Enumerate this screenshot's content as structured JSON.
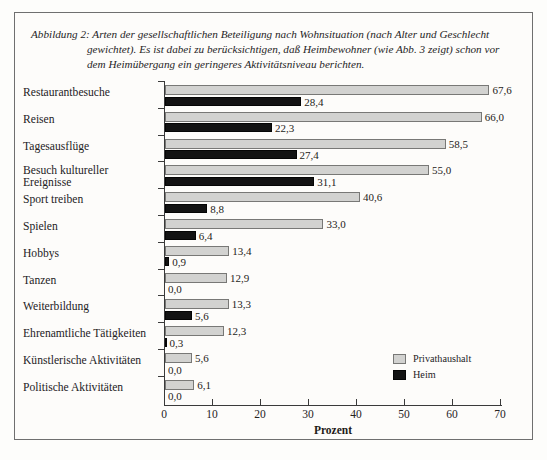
{
  "caption": {
    "lines": [
      "Abbildung 2: Arten der gesellschaftlichen Beteiligung nach Wohnsituation (nach Alter und Geschlecht",
      "gewichtet). Es ist dabei zu berücksichtigen, daß Heimbewohner (wie Abb. 3 zeigt) schon vor",
      "dem Heimübergang ein geringeres Aktivitätsniveau berichten."
    ]
  },
  "chart_data": {
    "type": "bar",
    "orientation": "horizontal",
    "xlabel": "Prozent",
    "ylabel": "",
    "xlim": [
      0,
      70
    ],
    "xticks": [
      0,
      10,
      20,
      30,
      40,
      50,
      60,
      70
    ],
    "xticklabels": [
      "0",
      "10",
      "20",
      "30",
      "40",
      "50",
      "60",
      "70"
    ],
    "grid": false,
    "legend_position": "bottom-right",
    "categories": [
      "Restaurantbesuche",
      "Reisen",
      "Tagesausflüge",
      "Besuch kultureller Ereignisse",
      "Sport treiben",
      "Spielen",
      "Hobbys",
      "Tanzen",
      "Weiterbildung",
      "Ehrenamtliche Tätigkeiten",
      "Künstlerische Aktivitäten",
      "Politische Aktivitäten"
    ],
    "category_lines": [
      [
        "Restaurantbesuche"
      ],
      [
        "Reisen"
      ],
      [
        "Tagesausflüge"
      ],
      [
        "Besuch kultureller",
        "Ereignisse"
      ],
      [
        "Sport treiben"
      ],
      [
        "Spielen"
      ],
      [
        "Hobbys"
      ],
      [
        "Tanzen"
      ],
      [
        "Weiterbildung"
      ],
      [
        "Ehrenamtliche Tätigkeiten"
      ],
      [
        "Künstlerische Aktivitäten"
      ],
      [
        "Politische Aktivitäten"
      ]
    ],
    "series": [
      {
        "name": "Privathaushalt",
        "color": "#d2d2d0",
        "values": [
          67.6,
          66.0,
          58.5,
          55.0,
          40.6,
          33.0,
          13.4,
          12.9,
          13.3,
          12.3,
          5.6,
          6.1
        ],
        "labels": [
          "67,6",
          "66,0",
          "58,5",
          "55,0",
          "40,6",
          "33,0",
          "13,4",
          "12,9",
          "13,3",
          "12,3",
          "5,6",
          "6,1"
        ]
      },
      {
        "name": "Heim",
        "color": "#131313",
        "values": [
          28.4,
          22.3,
          27.4,
          31.1,
          8.8,
          6.4,
          0.9,
          0.0,
          5.6,
          0.3,
          0.0,
          0.0
        ],
        "labels": [
          "28,4",
          "22,3",
          "27,4",
          "31,1",
          "8,8",
          "6,4",
          "0,9",
          "0,0",
          "5,6",
          "0,3",
          "0,0",
          "0,0"
        ]
      }
    ]
  },
  "legend": {
    "items": [
      {
        "label": "Privathaushalt",
        "swatch": "priv"
      },
      {
        "label": "Heim",
        "swatch": "heim"
      }
    ]
  }
}
